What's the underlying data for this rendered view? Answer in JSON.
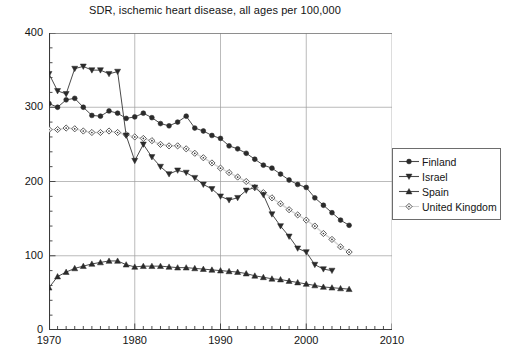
{
  "chart_data": {
    "type": "line",
    "title": "SDR, ischemic heart disease, all ages per 100,000",
    "xlabel": "",
    "ylabel": "",
    "xlim": [
      1970,
      2010
    ],
    "ylim": [
      0,
      400
    ],
    "ytick_labels": [
      "0",
      "100",
      "200",
      "300",
      "400"
    ],
    "yticks": [
      0,
      100,
      200,
      300,
      400
    ],
    "xtick_labels": [
      "1970",
      "1980",
      "1990",
      "2000",
      "2010"
    ],
    "xticks": [
      1970,
      1980,
      1990,
      2000,
      2010
    ],
    "minor_xtick_interval": 1,
    "minor_ytick_interval": 20,
    "grid": true,
    "grid_axes": "both-major",
    "legend_position": "right-outside",
    "series": [
      {
        "name": "Finland",
        "marker": "filled-circle",
        "color": "#333333",
        "x": [
          1970,
          1971,
          1972,
          1973,
          1974,
          1975,
          1976,
          1977,
          1978,
          1979,
          1980,
          1981,
          1982,
          1983,
          1984,
          1985,
          1986,
          1987,
          1988,
          1989,
          1990,
          1991,
          1992,
          1993,
          1994,
          1995,
          1996,
          1997,
          1998,
          1999,
          2000,
          2001,
          2002,
          2003,
          2004,
          2005
        ],
        "values": [
          305,
          300,
          310,
          312,
          300,
          289,
          288,
          295,
          292,
          285,
          287,
          292,
          286,
          278,
          275,
          280,
          288,
          272,
          268,
          262,
          258,
          248,
          244,
          238,
          230,
          222,
          218,
          210,
          202,
          196,
          192,
          178,
          168,
          158,
          148,
          141
        ]
      },
      {
        "name": "Israel",
        "marker": "filled-triangle-down",
        "color": "#333333",
        "x": [
          1970,
          1971,
          1972,
          1973,
          1974,
          1975,
          1976,
          1977,
          1978,
          1979,
          1980,
          1981,
          1982,
          1983,
          1984,
          1985,
          1986,
          1987,
          1988,
          1989,
          1990,
          1991,
          1992,
          1993,
          1994,
          1995,
          1996,
          1997,
          1998,
          1999,
          2000,
          2001,
          2002,
          2003
        ],
        "values": [
          345,
          322,
          318,
          352,
          355,
          350,
          350,
          345,
          348,
          262,
          228,
          250,
          233,
          220,
          210,
          215,
          212,
          205,
          196,
          190,
          180,
          175,
          178,
          188,
          192,
          182,
          156,
          140,
          126,
          110,
          105,
          88,
          82,
          80
        ]
      },
      {
        "name": "Spain",
        "marker": "filled-triangle-up",
        "color": "#141414",
        "x": [
          1970,
          1971,
          1972,
          1973,
          1974,
          1975,
          1976,
          1977,
          1978,
          1979,
          1980,
          1981,
          1982,
          1983,
          1984,
          1985,
          1986,
          1987,
          1988,
          1989,
          1990,
          1991,
          1992,
          1993,
          1994,
          1995,
          1996,
          1997,
          1998,
          1999,
          2000,
          2001,
          2002,
          2003,
          2004,
          2005
        ],
        "values": [
          57,
          72,
          78,
          83,
          86,
          89,
          91,
          93,
          93,
          88,
          85,
          86,
          86,
          86,
          85,
          84,
          84,
          83,
          82,
          81,
          80,
          79,
          78,
          76,
          73,
          71,
          69,
          68,
          66,
          64,
          62,
          60,
          58,
          57,
          56,
          55
        ]
      },
      {
        "name": "United Kingdom",
        "marker": "open-diamond",
        "color": "#cccccc",
        "x": [
          1970,
          1971,
          1972,
          1973,
          1974,
          1975,
          1976,
          1977,
          1978,
          1979,
          1980,
          1981,
          1982,
          1983,
          1984,
          1985,
          1986,
          1987,
          1988,
          1989,
          1990,
          1991,
          1992,
          1993,
          1994,
          1995,
          1996,
          1997,
          1998,
          1999,
          2000,
          2001,
          2002,
          2003,
          2004,
          2005
        ],
        "values": [
          270,
          270,
          272,
          271,
          268,
          266,
          266,
          268,
          266,
          263,
          260,
          258,
          255,
          250,
          248,
          248,
          244,
          238,
          232,
          225,
          218,
          212,
          206,
          200,
          192,
          185,
          178,
          170,
          162,
          155,
          148,
          140,
          130,
          122,
          112,
          105
        ]
      }
    ]
  },
  "legend": {
    "items": [
      {
        "label": "Finland",
        "marker": "filled-circle"
      },
      {
        "label": "Israel",
        "marker": "filled-triangle-down"
      },
      {
        "label": "Spain",
        "marker": "filled-triangle-up"
      },
      {
        "label": "United Kingdom",
        "marker": "open-diamond"
      }
    ]
  }
}
